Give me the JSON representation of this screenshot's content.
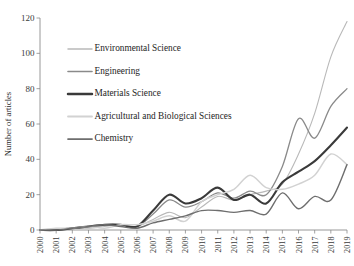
{
  "chart_data": {
    "type": "line",
    "title": "",
    "xlabel": "",
    "ylabel": "Number of articles",
    "xlim": [
      2000,
      2019
    ],
    "ylim": [
      0,
      120
    ],
    "ytick_step": 20,
    "grid": false,
    "legend_position": "upper-left-inside",
    "x": [
      2000,
      2001,
      2002,
      2003,
      2004,
      2005,
      2006,
      2007,
      2008,
      2009,
      2010,
      2011,
      2012,
      2013,
      2014,
      2015,
      2016,
      2017,
      2018,
      2019
    ],
    "categories": [
      "2000",
      "2001",
      "2002",
      "2003",
      "2004",
      "2005",
      "2006",
      "2007",
      "2008",
      "2009",
      "2010",
      "2011",
      "2012",
      "2013",
      "2014",
      "2015",
      "2016",
      "2017",
      "2018",
      "2019"
    ],
    "yticks": [
      "0",
      "20",
      "40",
      "60",
      "80",
      "100",
      "120"
    ],
    "series": [
      {
        "name": "Environmental Science",
        "color": "#b9b9b9",
        "width": 1.1,
        "values": [
          0,
          0,
          1,
          1,
          2,
          3,
          2,
          6,
          10,
          7,
          13,
          19,
          17,
          20,
          22,
          26,
          43,
          66,
          98,
          118
        ]
      },
      {
        "name": "Engineering",
        "color": "#8a8a8a",
        "width": 1.3,
        "values": [
          0,
          0,
          1,
          2,
          3,
          3,
          2,
          9,
          17,
          13,
          16,
          21,
          18,
          22,
          20,
          36,
          63,
          52,
          70,
          80
        ]
      },
      {
        "name": "Materials Science",
        "color": "#3a3a3a",
        "width": 2.1,
        "values": [
          0,
          0,
          1,
          2,
          3,
          3,
          2,
          11,
          20,
          15,
          18,
          24,
          17,
          20,
          15,
          27,
          33,
          39,
          48,
          58
        ]
      },
      {
        "name": "Agricultural and Biological Sciences",
        "color": "#d2d2d2",
        "width": 1.5,
        "values": [
          0,
          1,
          1,
          2,
          1,
          3,
          3,
          5,
          8,
          5,
          16,
          20,
          23,
          31,
          24,
          23,
          26,
          31,
          43,
          37
        ]
      },
      {
        "name": "Chemistry",
        "color": "#6e6e6e",
        "width": 1.4,
        "values": [
          0,
          0,
          1,
          2,
          3,
          2,
          1,
          4,
          6,
          8,
          11,
          11,
          10,
          11,
          9,
          21,
          12,
          19,
          17,
          37
        ]
      }
    ]
  },
  "legend": {
    "items": [
      {
        "label": "Environmental Science"
      },
      {
        "label": "Engineering"
      },
      {
        "label": "Materials Science"
      },
      {
        "label": "Agricultural and Biological Sciences"
      },
      {
        "label": "Chemistry"
      }
    ]
  }
}
